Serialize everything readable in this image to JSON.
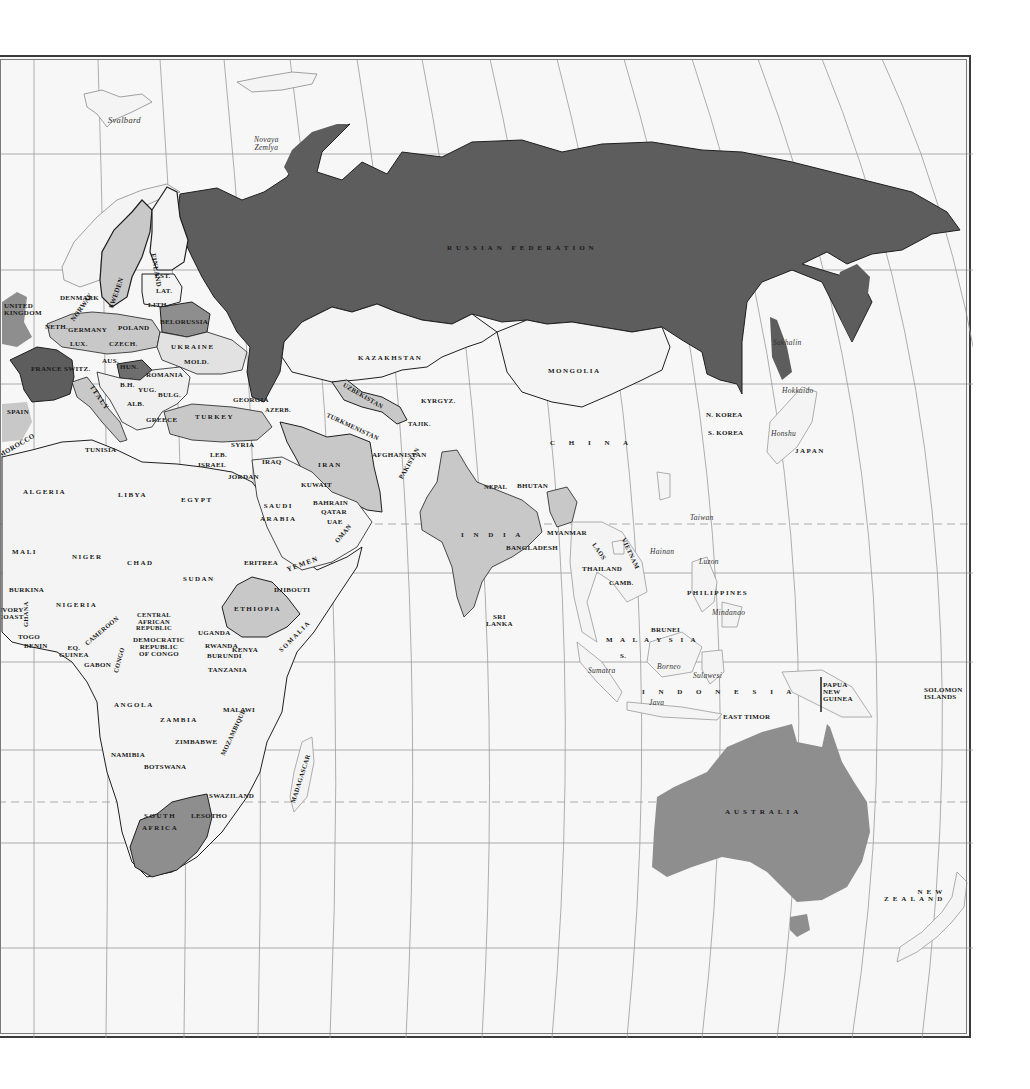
{
  "map": {
    "title": "Eastern Hemisphere political map",
    "colors": {
      "ocean": "#f7f7f7",
      "land_default": "#f4f4f4",
      "shade_dark": "#5d5d5d",
      "shade_medium": "#8e8e8e",
      "shade_light": "#c8c8c8",
      "border": "#1f1f1f",
      "graticule": "#9a9a9a",
      "frame": "#3a3a3a"
    },
    "countries": {
      "russia": "RUSSIAN FEDERATION",
      "finland": "FINLAND",
      "sweden": "SWEDEN",
      "norway": "NORWAY",
      "denmark": "DENMARK",
      "uk": "UNITED\nKINGDOM",
      "netherlands": "NETH.",
      "germany": "GERMANY",
      "poland": "POLAND",
      "belorussia": "BELORUSSIA",
      "estonia": "EST.",
      "latvia": "LAT.",
      "lithuania": "LITH.",
      "luxembourg": "LUX.",
      "czech": "CZECH.",
      "slovakia": "SLK.",
      "ukraine": "UKRAINE",
      "moldova": "MOLD.",
      "france": "FRANCE",
      "switzerland": "SWITZ.",
      "austria": "AUS.",
      "hungary": "HUN.",
      "romania": "ROMANIA",
      "slovenia": "SLO.",
      "croatia": "CRO.",
      "bosnia": "B.H.",
      "yugoslavia": "YUG.",
      "bulgaria": "BULG.",
      "albania": "ALB.",
      "greece": "GREECE",
      "italy": "ITALY",
      "spain": "SPAIN",
      "turkey": "TURKEY",
      "georgia": "GEORGIA",
      "azerbaijan": "AZERB.",
      "armenia": "ARMENIA",
      "kazakhstan": "KAZAKHSTAN",
      "uzbekistan": "UZBEKISTAN",
      "turkmenistan": "TURKMENISTAN",
      "kyrgyzstan": "KYRGYZ.",
      "tajikistan": "TAJIK.",
      "afghanistan": "AFGHANISTAN",
      "pakistan": "PAKISTAN",
      "iran": "IRAN",
      "iraq": "IRAQ",
      "syria": "SYRIA",
      "lebanon": "LEB.",
      "israel": "ISRAEL",
      "jordan": "JORDAN",
      "kuwait": "KUWAIT",
      "bahrain": "BAHRAIN",
      "qatar": "QATAR",
      "uae": "UAE",
      "saudi": "SAUDI\nARABIA",
      "oman": "OMAN",
      "yemen": "YEMEN",
      "mongolia": "MONGOLIA",
      "china": "C H I N A",
      "n_korea": "N. KOREA",
      "s_korea": "S. KOREA",
      "japan": "JAPAN",
      "india": "I N D I A",
      "nepal": "NEPAL",
      "bhutan": "BHUTAN",
      "bangladesh": "BANGLADESH",
      "sri_lanka": "SRI\nLANKA",
      "myanmar": "MYANMAR",
      "laos": "LAOS",
      "vietnam": "VIETNAM",
      "thailand": "THAILAND",
      "cambodia": "CAMB.",
      "malaysia": "M A L A Y S I A",
      "singapore": "S.",
      "brunei": "BRUNEI",
      "philippines": "PHILIPPINES",
      "indonesia": "I N D O N E S I A",
      "east_timor": "EAST TIMOR",
      "png": "PAPUA\nNEW\nGUINEA",
      "solomon": "SOLOMON\nISLANDS",
      "australia": "AUSTRALIA",
      "new_zealand": "NEW\nZEALAND",
      "morocco": "MOROCCO",
      "algeria": "ALGERIA",
      "tunisia": "TUNISIA",
      "libya": "LIBYA",
      "egypt": "EGYPT",
      "mali": "MALI",
      "niger": "NIGER",
      "chad": "CHAD",
      "sudan": "SUDAN",
      "eritrea": "ERITREA",
      "djibouti": "DJIBOUTI",
      "ethiopia": "ETHIOPIA",
      "somalia": "SOMALIA",
      "burkina": "BURKINA",
      "ivory_coast": "IVORY\nCOAST",
      "ghana": "GHANA",
      "togo": "TOGO",
      "benin": "BENIN",
      "nigeria": "NIGERIA",
      "cameroon": "CAMEROON",
      "car": "CENTRAL\nAFRICAN\nREPUBLIC",
      "eq_guinea": "EQ.\nGUINEA",
      "gabon": "GABON",
      "congo": "CONGO",
      "drc": "DEMOCRATIC\nREPUBLIC\nOF CONGO",
      "uganda": "UGANDA",
      "kenya": "KENYA",
      "rwanda": "RWANDA",
      "burundi": "BURUNDI",
      "tanzania": "TANZANIA",
      "angola": "ANGOLA",
      "zambia": "ZAMBIA",
      "malawi": "MALAWI",
      "mozambique": "MOZAMBIQUE",
      "zimbabwe": "ZIMBABWE",
      "namibia": "NAMIBIA",
      "botswana": "BOTSWANA",
      "madagascar": "MADAGASCAR",
      "swaziland": "SWAZILAND",
      "lesotho": "LESOTHO",
      "south_africa": "SOUTH\nAFRICA"
    },
    "features": {
      "svalbard": "Svalbard",
      "novaya_zemlya": "Novaya\nZemlya",
      "sakhalin": "Sakhalin",
      "hokkaido": "Hokkaido",
      "honshu": "Honshu",
      "taiwan": "Taiwan",
      "hainan": "Hainan",
      "luzon": "Luzon",
      "mindanao": "Mindanao",
      "borneo": "Borneo",
      "sumatra": "Sumatra",
      "sulawesi": "Sulawesi",
      "java": "Java"
    }
  }
}
